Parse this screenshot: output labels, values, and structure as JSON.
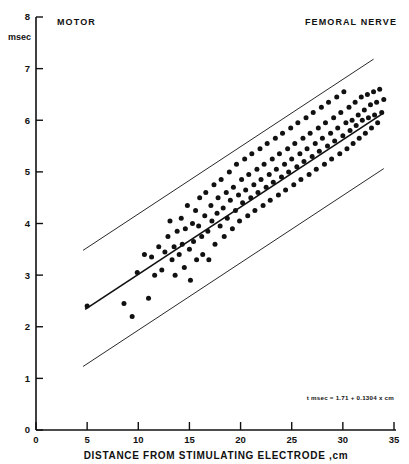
{
  "figure": {
    "label_motor": "MOTOR",
    "label_nerve": "FEMORAL NERVE",
    "y_unit": "msec",
    "equation": "t msec = 1.71 + 0.1304 x cm"
  },
  "chart_data": {
    "type": "scatter",
    "title": "MOTOR",
    "subtitle": "FEMORAL NERVE",
    "xlabel": "DISTANCE FROM STIMULATING ELECTRODE ,cm",
    "ylabel": "msec",
    "xlim": [
      0,
      35
    ],
    "ylim": [
      0,
      8
    ],
    "xticks": [
      0,
      5,
      10,
      15,
      20,
      25,
      30,
      35
    ],
    "yticks": [
      0,
      1,
      2,
      3,
      4,
      5,
      6,
      7,
      8
    ],
    "grid": false,
    "legend": "none",
    "annotation": "t msec = 1.71 + 0.1304 x cm",
    "regression": {
      "intercept": 1.71,
      "slope": 0.1304,
      "x_start": 4.8,
      "x_end": 34.0
    },
    "bands": [
      {
        "name": "upper-limit-line",
        "intercept": 2.88,
        "slope": 0.1304,
        "x_start": 4.6,
        "x_end": 33.0
      },
      {
        "name": "lower-limit-line",
        "intercept": 0.63,
        "slope": 0.1304,
        "x_start": 4.6,
        "x_end": 34.0
      }
    ],
    "x": [
      5.0,
      8.6,
      9.4,
      9.9,
      10.6,
      11.0,
      11.3,
      11.6,
      12.0,
      12.3,
      12.6,
      12.9,
      13.1,
      13.3,
      13.5,
      13.6,
      13.8,
      14.0,
      14.2,
      14.3,
      14.5,
      14.6,
      14.8,
      15.0,
      15.1,
      15.3,
      15.4,
      15.6,
      15.7,
      15.9,
      16.0,
      16.2,
      16.3,
      16.5,
      16.6,
      16.8,
      16.9,
      17.1,
      17.2,
      17.4,
      17.5,
      17.7,
      17.8,
      18.0,
      18.1,
      18.3,
      18.4,
      18.6,
      18.7,
      18.9,
      19.0,
      19.2,
      19.3,
      19.5,
      19.6,
      19.8,
      19.9,
      20.1,
      20.2,
      20.4,
      20.5,
      20.7,
      20.8,
      21.0,
      21.1,
      21.3,
      21.4,
      21.6,
      21.7,
      21.9,
      22.0,
      22.2,
      22.3,
      22.5,
      22.6,
      22.8,
      22.9,
      23.1,
      23.2,
      23.4,
      23.5,
      23.7,
      23.8,
      24.0,
      24.1,
      24.3,
      24.4,
      24.6,
      24.7,
      24.9,
      25.0,
      25.2,
      25.3,
      25.5,
      25.6,
      25.8,
      25.9,
      26.1,
      26.2,
      26.4,
      26.5,
      26.7,
      26.8,
      27.0,
      27.1,
      27.3,
      27.4,
      27.6,
      27.7,
      27.9,
      28.0,
      28.2,
      28.3,
      28.5,
      28.6,
      28.8,
      28.9,
      29.1,
      29.2,
      29.4,
      29.5,
      29.7,
      29.8,
      30.0,
      30.1,
      30.3,
      30.4,
      30.6,
      30.7,
      30.9,
      31.0,
      31.2,
      31.3,
      31.5,
      31.6,
      31.8,
      31.9,
      32.1,
      32.2,
      32.4,
      32.5,
      32.7,
      32.8,
      33.0,
      33.1,
      33.3,
      33.4,
      33.6,
      33.8,
      34.0
    ],
    "y": [
      2.4,
      2.45,
      2.2,
      3.05,
      3.4,
      2.55,
      3.35,
      3.0,
      3.55,
      3.1,
      3.45,
      3.75,
      4.05,
      3.3,
      3.55,
      3.0,
      3.85,
      3.4,
      4.1,
      3.6,
      3.15,
      3.9,
      4.35,
      3.5,
      2.9,
      4.0,
      3.65,
      4.25,
      3.3,
      3.95,
      4.5,
      3.75,
      3.4,
      4.15,
      4.6,
      3.85,
      3.3,
      4.35,
      4.05,
      4.75,
      3.6,
      4.2,
      4.5,
      3.95,
      4.85,
      4.3,
      3.75,
      4.6,
      4.1,
      5.0,
      4.45,
      3.9,
      4.7,
      4.25,
      5.15,
      4.55,
      4.05,
      4.85,
      4.4,
      5.25,
      4.65,
      4.15,
      4.95,
      4.5,
      5.35,
      4.75,
      4.25,
      5.05,
      4.6,
      5.45,
      4.85,
      4.35,
      5.15,
      4.7,
      5.55,
      4.95,
      4.45,
      5.25,
      4.8,
      5.65,
      5.05,
      4.55,
      5.35,
      4.9,
      5.75,
      5.15,
      4.65,
      5.45,
      5.0,
      5.85,
      5.25,
      4.75,
      5.55,
      5.1,
      5.95,
      5.35,
      4.85,
      5.65,
      5.2,
      6.05,
      5.45,
      4.95,
      5.75,
      5.3,
      6.15,
      5.55,
      5.05,
      5.85,
      5.4,
      6.25,
      5.65,
      5.15,
      5.95,
      5.5,
      6.35,
      5.75,
      5.25,
      6.05,
      5.6,
      6.45,
      5.85,
      5.35,
      6.15,
      5.7,
      6.55,
      5.95,
      5.45,
      6.25,
      5.8,
      6.0,
      5.55,
      6.35,
      5.9,
      6.1,
      5.65,
      6.45,
      6.0,
      6.2,
      5.75,
      6.5,
      6.05,
      6.3,
      5.85,
      6.55,
      6.1,
      6.35,
      5.95,
      6.6,
      6.15,
      6.4,
      6.05,
      6.5
    ]
  }
}
